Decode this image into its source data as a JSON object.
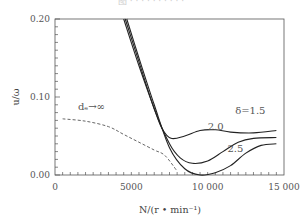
{
  "chart_data": {
    "type": "line",
    "title": "",
    "xlabel": "N/(r • min⁻¹)",
    "ylabel": "u/ω",
    "xlim": [
      0,
      15000
    ],
    "ylim": [
      0.0,
      0.2
    ],
    "x_ticks": [
      0,
      5000,
      10000,
      15000
    ],
    "x_tick_labels": [
      "0",
      "5000",
      "10 000",
      "15 000"
    ],
    "y_ticks": [
      0.0,
      0.1,
      0.2
    ],
    "y_tick_labels": [
      "0.00",
      "0.10",
      "0.20"
    ],
    "grid": false,
    "legend": "inline labels",
    "series": [
      {
        "name": "δ=1.5",
        "style": "solid",
        "x": [
          4500,
          5500,
          6500,
          7000,
          7600,
          8500,
          9500,
          10500,
          11500,
          13000,
          14500
        ],
        "y": [
          0.2,
          0.14,
          0.085,
          0.06,
          0.047,
          0.05,
          0.057,
          0.058,
          0.055,
          0.054,
          0.057
        ]
      },
      {
        "name": "2.0",
        "style": "solid",
        "x": [
          4600,
          5500,
          6500,
          7500,
          8200,
          9000,
          10000,
          11000,
          12000,
          13000,
          14500
        ],
        "y": [
          0.2,
          0.145,
          0.085,
          0.04,
          0.022,
          0.015,
          0.018,
          0.03,
          0.042,
          0.047,
          0.048
        ]
      },
      {
        "name": "2.5",
        "style": "solid",
        "x": [
          4700,
          5500,
          6500,
          7500,
          8500,
          9500,
          10500,
          11500,
          12500,
          13500,
          14500
        ],
        "y": [
          0.2,
          0.15,
          0.09,
          0.035,
          0.008,
          0.0,
          0.003,
          0.012,
          0.028,
          0.038,
          0.04
        ]
      },
      {
        "name": "dₑ→∞",
        "style": "dashed",
        "x": [
          500,
          2000,
          3500,
          4500,
          5500,
          6500,
          7200,
          8000
        ],
        "y": [
          0.072,
          0.069,
          0.062,
          0.052,
          0.042,
          0.032,
          0.025,
          0.005
        ]
      }
    ],
    "annotations": [
      {
        "text": "δ=1.5",
        "x": 11800,
        "y": 0.078
      },
      {
        "text": "2.0",
        "x": 10000,
        "y": 0.058
      },
      {
        "text": "2.5",
        "x": 11300,
        "y": 0.03
      },
      {
        "text": "dₑ→∞",
        "x": 1500,
        "y": 0.083
      }
    ]
  },
  "labels": {
    "x_axis_title": "N/(r • min⁻¹)",
    "y_axis_title": "u/ω",
    "cropped_title": "图 · · · · · · · · · ·"
  }
}
